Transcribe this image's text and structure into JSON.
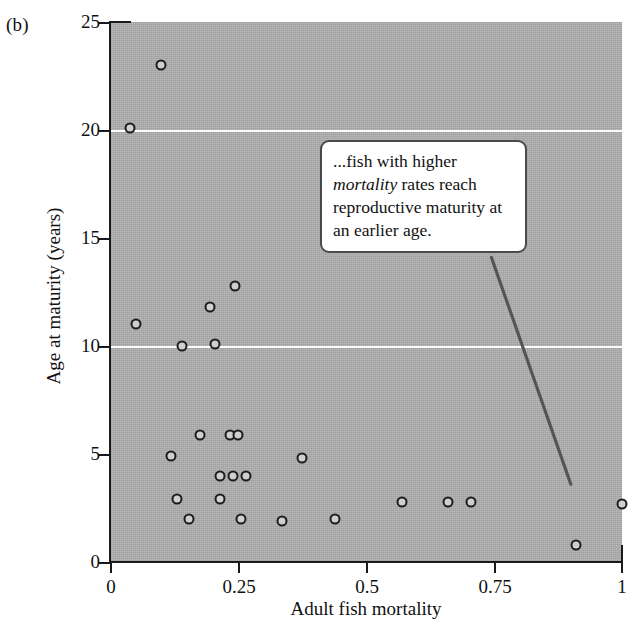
{
  "panel": {
    "label": "(b)"
  },
  "callout": {
    "text_before": "...fish with higher ",
    "emphasis": "mortality",
    "text_after": " rates reach reproductive maturity at an earlier age.",
    "full_text": "...fish with higher mortality rates reach reproductive maturity at an earlier age."
  },
  "colors": {
    "plot_background": "#b0b0b0",
    "gridline": "#fdfdfd",
    "axis": "#1a1a1a",
    "marker_edge": "#1d1d1d",
    "marker_fill": "#cfcfcf",
    "callout_border": "#4a4a4a",
    "callout_background": "#ffffff",
    "leader_line": "#555555",
    "page_background": "#ffffff"
  },
  "chart_data": {
    "type": "scatter",
    "title": "",
    "xlabel": "Adult fish mortality",
    "ylabel": "Age at maturity (years)",
    "xlim": [
      0,
      1
    ],
    "ylim": [
      0,
      25
    ],
    "xticks": [
      0,
      0.25,
      0.5,
      0.75,
      1
    ],
    "xtick_labels": [
      "0",
      "0.25",
      "0.5",
      "0.75",
      "1"
    ],
    "yticks": [
      0,
      5,
      10,
      15,
      20,
      25
    ],
    "ytick_labels": [
      "0",
      "5",
      "10",
      "15",
      "20",
      "25"
    ],
    "gridlines_y": [
      10,
      20
    ],
    "grid": true,
    "legend": null,
    "marker": "open-circle",
    "points": [
      {
        "x": 0.1,
        "y": 23.0
      },
      {
        "x": 0.04,
        "y": 20.1
      },
      {
        "x": 0.245,
        "y": 12.8
      },
      {
        "x": 0.195,
        "y": 11.8
      },
      {
        "x": 0.05,
        "y": 11.0
      },
      {
        "x": 0.205,
        "y": 10.1
      },
      {
        "x": 0.14,
        "y": 10.0
      },
      {
        "x": 0.175,
        "y": 5.9
      },
      {
        "x": 0.235,
        "y": 5.9
      },
      {
        "x": 0.25,
        "y": 5.9
      },
      {
        "x": 0.12,
        "y": 4.9
      },
      {
        "x": 0.375,
        "y": 4.8
      },
      {
        "x": 0.215,
        "y": 4.0
      },
      {
        "x": 0.24,
        "y": 4.0
      },
      {
        "x": 0.265,
        "y": 4.0
      },
      {
        "x": 0.13,
        "y": 2.9
      },
      {
        "x": 0.215,
        "y": 2.9
      },
      {
        "x": 0.57,
        "y": 2.8
      },
      {
        "x": 0.66,
        "y": 2.8
      },
      {
        "x": 0.705,
        "y": 2.8
      },
      {
        "x": 1.0,
        "y": 2.7
      },
      {
        "x": 0.155,
        "y": 2.0
      },
      {
        "x": 0.255,
        "y": 2.0
      },
      {
        "x": 0.335,
        "y": 1.9
      },
      {
        "x": 0.44,
        "y": 2.0
      },
      {
        "x": 0.91,
        "y": 0.8
      }
    ],
    "annotations": [
      {
        "text": "...fish with higher mortality rates reach reproductive maturity at an earlier age.",
        "box_x": 0.41,
        "box_y": 18.2,
        "leader_from": [
          0.745,
          14.1
        ],
        "leader_to": [
          0.9,
          3.6
        ]
      }
    ]
  }
}
